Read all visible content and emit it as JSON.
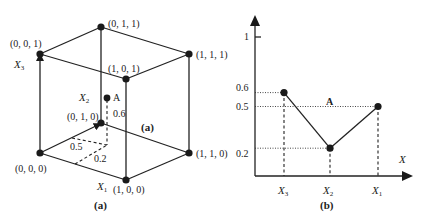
{
  "panel_a": {
    "caption": "(a)",
    "inner_caption": "(a)",
    "vertices": [
      {
        "id": "v000",
        "label": "(0, 0, 0)"
      },
      {
        "id": "v010",
        "label": "(0, 1, 0)"
      },
      {
        "id": "v001",
        "label": "(0, 0, 1)"
      },
      {
        "id": "v011",
        "label": "(0, 1, 1)"
      },
      {
        "id": "v101",
        "label": "(1, 0, 1)"
      },
      {
        "id": "v111",
        "label": "(1, 1, 1)"
      },
      {
        "id": "v110",
        "label": "(1, 1, 0)"
      },
      {
        "id": "v100",
        "label": "(1, 0, 0)"
      }
    ],
    "axes": {
      "x1": {
        "main": "X",
        "sub": "1"
      },
      "x2": {
        "main": "X",
        "sub": "2"
      },
      "x3": {
        "main": "X",
        "sub": "3"
      }
    },
    "point": {
      "label": "A",
      "x1": 0.2,
      "x2": 0.5,
      "x3": 0.6
    },
    "dim_labels": {
      "x1": "0.2",
      "x2": "0.5",
      "x3": "0.6"
    }
  },
  "panel_b": {
    "caption": "(b)",
    "x_axis_label": "X",
    "y_ticks": [
      "1",
      "0.6",
      "0.5",
      "0.2"
    ],
    "point_label": "A"
  },
  "chart_data": {
    "type": "line",
    "title": "",
    "xlabel": "X",
    "ylabel": "",
    "categories": [
      "X3",
      "X2",
      "X1"
    ],
    "series": [
      {
        "name": "A",
        "values": [
          0.6,
          0.2,
          0.5
        ]
      }
    ],
    "ylim": [
      0,
      1
    ],
    "y_ticks": [
      0.2,
      0.5,
      0.6,
      1
    ],
    "grid": false,
    "annotations": [
      "A"
    ]
  }
}
